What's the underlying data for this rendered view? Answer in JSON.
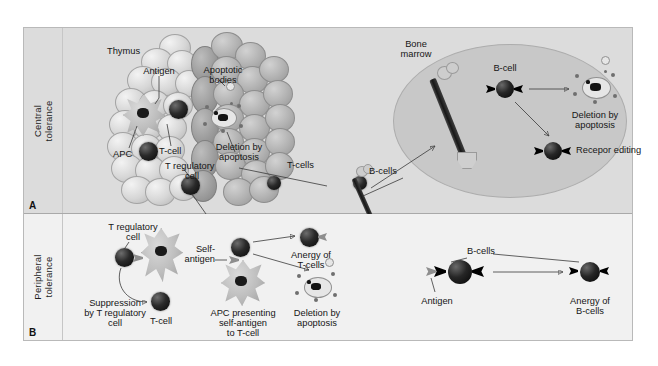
{
  "figure": {
    "panels": [
      {
        "key": "A",
        "side_label_line1": "Central",
        "side_label_line2": "tolerance",
        "labels": {
          "thymus": "Thymus",
          "antigen": "Antigen",
          "apoptotic_bodies_line1": "Apoptotic",
          "apoptotic_bodies_line2": "bodies",
          "apc": "APC",
          "t_cell": "T-cell",
          "t_regulatory_line1": "T regulatory",
          "t_regulatory_line2": "cell",
          "deletion_line1": "Deletion by",
          "deletion_line2": "apoptosis",
          "t_cells": "T-cells",
          "b_cells": "B-cells",
          "bone_marrow_line1": "Bone",
          "bone_marrow_line2": "marrow",
          "b_cell": "B-cell",
          "marrow_deletion_line1": "Deletion by",
          "marrow_deletion_line2": "apoptosis",
          "receptor_editing": "Recepor editing"
        }
      },
      {
        "key": "B",
        "side_label_line1": "Peripheral",
        "side_label_line2": "tolerance",
        "labels": {
          "t_regulatory_line1": "T regulatory",
          "t_regulatory_line2": "cell",
          "suppression_line1": "Suppression",
          "suppression_line2": "by T regulatory",
          "suppression_line3": "cell",
          "t_cell": "T-cell",
          "self_antigen_line1": "Self-",
          "self_antigen_line2": "antigen",
          "apc_presenting_line1": "APC presenting",
          "apc_presenting_line2": "self-antigen",
          "apc_presenting_line3": "to T-cell",
          "anergy_t_line1": "Anergy of",
          "anergy_t_line2": "T-cells",
          "deletion_line1": "Deletion by",
          "deletion_line2": "apoptosis",
          "b_cells": "B-cells",
          "antigen": "Antigen",
          "anergy_b_line1": "Anergy of",
          "anergy_b_line2": "B-cells"
        }
      }
    ]
  },
  "colors": {
    "panel_a_background": "#dcdcdc",
    "panel_b_background": "#f1f1f1",
    "marrow_fill": "#c8c8c8",
    "cell_nucleus": "#0a0a0a",
    "receptor": "#000000",
    "frame_border": "#b9b9b9"
  }
}
